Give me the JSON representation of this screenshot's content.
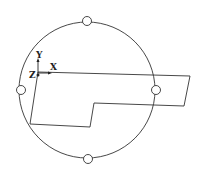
{
  "diagram": {
    "axis_labels": {
      "x": "X",
      "y": "Y",
      "z": "Z"
    },
    "stroke_color": "#333333",
    "background": "#ffffff",
    "main_circle": {
      "cx": 87,
      "cy": 90,
      "r": 68
    },
    "markers": [
      {
        "name": "top",
        "cx": 87,
        "cy": 21
      },
      {
        "name": "bottom",
        "cx": 88,
        "cy": 159
      },
      {
        "name": "left",
        "cx": 21,
        "cy": 90
      },
      {
        "name": "right",
        "cx": 156,
        "cy": 90
      }
    ],
    "polygon_points": "38,72 190,76 184,106 94,103 90,127 30,124"
  }
}
